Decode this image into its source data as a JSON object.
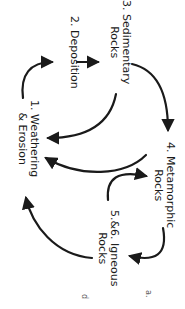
{
  "diagram": {
    "stages": [
      {
        "lines": [
          "2. Deposition"
        ]
      },
      {
        "lines": [
          "3. Sedimentary",
          "Rocks"
        ]
      },
      {
        "lines": [
          "1. Weathering",
          "& Erosion"
        ]
      },
      {
        "lines": [
          "4. Metamorphic",
          "Rocks"
        ]
      },
      {
        "lines": [
          "5.&6. Igneous",
          "Rocks"
        ]
      }
    ],
    "arrows": [
      {
        "from": "1. Weathering & Erosion",
        "to": "2. Deposition"
      },
      {
        "from": "2. Deposition",
        "to": "3. Sedimentary Rocks"
      },
      {
        "from": "3. Sedimentary Rocks",
        "to": "4. Metamorphic Rocks"
      },
      {
        "from": "3. Sedimentary Rocks",
        "to": "1. Weathering & Erosion"
      },
      {
        "from": "4. Metamorphic Rocks",
        "to": "1. Weathering & Erosion"
      },
      {
        "from": "4. Metamorphic Rocks",
        "to": "5.&6. Igneous Rocks"
      },
      {
        "from": "5.&6. Igneous Rocks",
        "to": "4. Metamorphic Rocks"
      },
      {
        "from": "5.&6. Igneous Rocks",
        "to": "1. Weathering & Erosion"
      }
    ],
    "fragments": [
      "a.",
      "d"
    ],
    "colors": {
      "stroke": "#1a1a1a",
      "background": "#ffffff"
    }
  }
}
